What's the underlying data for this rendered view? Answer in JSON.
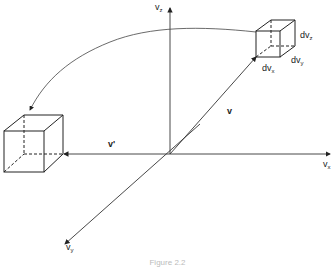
{
  "diagram": {
    "type": "velocity-space",
    "axes": {
      "vz": {
        "label": "v",
        "sub": "z"
      },
      "vx": {
        "label": "v",
        "sub": "x"
      },
      "vy": {
        "label": "v",
        "sub": "y"
      }
    },
    "vectors": {
      "v": {
        "label": "v"
      },
      "v_prime": {
        "label": "v'"
      }
    },
    "small_cube": {
      "labels": {
        "dvx": {
          "label": "dv",
          "sub": "x"
        },
        "dvy": {
          "label": "dv",
          "sub": "y"
        },
        "dvz": {
          "label": "dv",
          "sub": "z"
        }
      }
    },
    "large_cube": {},
    "arc_arrow": {
      "from": "small_cube",
      "to": "large_cube"
    },
    "caption": "Figure 2.2"
  },
  "colors": {
    "line": "#333333",
    "text": "#222222",
    "background": "#ffffff"
  }
}
